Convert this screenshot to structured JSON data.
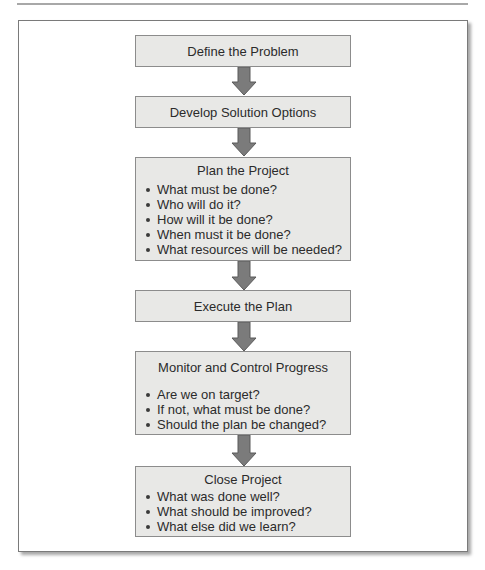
{
  "diagram": {
    "type": "flowchart",
    "direction": "top-to-bottom",
    "colors": {
      "box_fill": "#e8e8e6",
      "box_border": "#8c8c8c",
      "arrow_fill": "#7b7b7b",
      "arrow_border": "#5a5a5a",
      "text": "#2b2b2b"
    },
    "steps": [
      {
        "title": "Define the Problem",
        "bullets": []
      },
      {
        "title": "Develop Solution Options",
        "bullets": []
      },
      {
        "title": "Plan the Project",
        "bullets": [
          "What must be done?",
          "Who will do it?",
          "How will it be done?",
          "When must it be done?",
          "What resources will be needed?"
        ]
      },
      {
        "title": "Execute the Plan",
        "bullets": []
      },
      {
        "title": "Monitor and Control Progress",
        "bullets": [
          "Are we on target?",
          "If not, what must be done?",
          "Should the plan be changed?"
        ]
      },
      {
        "title": "Close Project",
        "bullets": [
          "What was done well?",
          "What should be improved?",
          "What else did we learn?"
        ]
      }
    ]
  }
}
